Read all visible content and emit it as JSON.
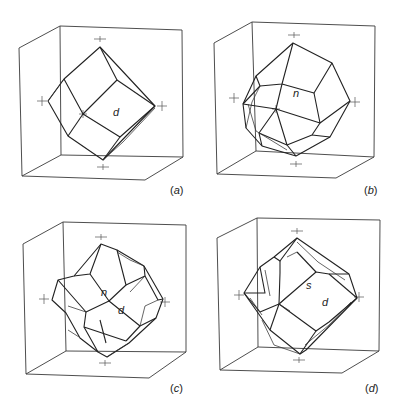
{
  "figure": {
    "panels": [
      {
        "id": "a",
        "label_open": "(",
        "label_letter": "a",
        "label_close": ")",
        "form": "rhombic dodecahedron",
        "face_labels": [
          "d"
        ]
      },
      {
        "id": "b",
        "label_open": "(",
        "label_letter": "b",
        "label_close": ")",
        "form": "trapezohedron",
        "face_labels": [
          "n"
        ]
      },
      {
        "id": "c",
        "label_open": "(",
        "label_letter": "c",
        "label_close": ")",
        "form": "dodecahedron modified by trapezohedron",
        "face_labels": [
          "n",
          "d"
        ]
      },
      {
        "id": "d",
        "label_open": "(",
        "label_letter": "d",
        "label_close": ")",
        "form": "dodecahedron modified by hexoctahedron",
        "face_labels": [
          "s",
          "d"
        ]
      }
    ]
  },
  "colors": {
    "background": "#ffffff",
    "line": "#222222",
    "axis": "#555555"
  }
}
